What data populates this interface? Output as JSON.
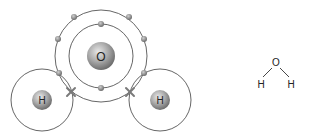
{
  "diagram": {
    "oxygen": {
      "symbol": "O",
      "inner_shell_electrons": 2,
      "outer_shell_electrons": 6
    },
    "hydrogens": [
      {
        "symbol": "H",
        "shell_electrons": 0,
        "shared_marker": "cross"
      },
      {
        "symbol": "H",
        "shell_electrons": 0,
        "shared_marker": "cross"
      }
    ],
    "colors": {
      "shell": "#555555",
      "electron": "#8a8a8a",
      "nucleus": "#9a9a9a",
      "cross": "#7a7a7a",
      "text": "#222222"
    }
  },
  "formula": {
    "center": "O",
    "left": "H",
    "right": "H"
  }
}
